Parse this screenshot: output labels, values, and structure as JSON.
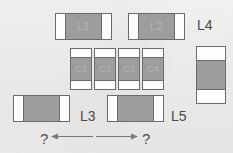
{
  "figure": {
    "kind": "smd-component-layout-diagram",
    "background_color": "#f2f1ef",
    "body_color": "#9d9d9d",
    "termination_color": "#fdfdfc",
    "outline_color": "#6b6b6b",
    "marking_color": "#b5b5b5",
    "label_color": "#4a4a4a"
  },
  "components": {
    "inductor_l1": {
      "marking": "L1"
    },
    "inductor_l2": {
      "marking": "L2"
    },
    "capacitor_c1": {
      "marking": "C1"
    },
    "capacitor_c2": {
      "marking": "C2"
    },
    "capacitor_c3": {
      "marking": "C3"
    },
    "capacitor_c4": {
      "marking": "C4"
    },
    "inductor_l4": {
      "marking": ""
    },
    "inductor_l3": {
      "marking": ""
    },
    "inductor_l5": {
      "marking": ""
    }
  },
  "labels": {
    "l4": "L4",
    "l3": "L3",
    "l5": "L5"
  },
  "dimensions": {
    "left_unknown": "?",
    "right_unknown": "?"
  }
}
